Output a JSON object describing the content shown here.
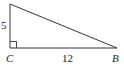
{
  "diagram": {
    "type": "right-triangle",
    "vertices": {
      "A": {
        "x": 10,
        "y": 4,
        "label": ""
      },
      "C": {
        "x": 10,
        "y": 48,
        "label": "C"
      },
      "B": {
        "x": 117,
        "y": 48,
        "label": "B"
      }
    },
    "right_angle_at": "C",
    "sides": [
      {
        "between": [
          "A",
          "C"
        ],
        "label": "5"
      },
      {
        "between": [
          "C",
          "B"
        ],
        "label": "12"
      }
    ],
    "stroke_color": "#333333",
    "background": "#ffffff"
  }
}
